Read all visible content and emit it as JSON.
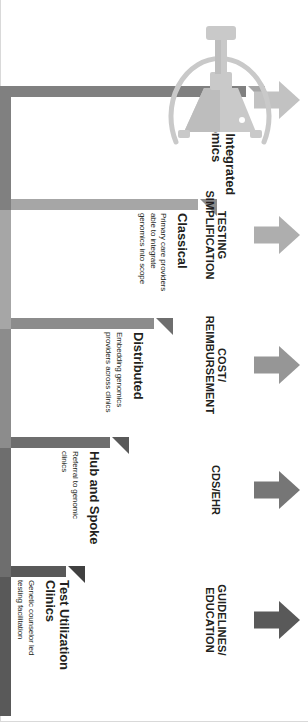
{
  "figure": {
    "orientation": "rotated-90",
    "background_color": "#ffffff"
  },
  "steps": [
    {
      "label": "Test Utilization\nClinics",
      "label_line1": "Test Utilization",
      "label_line2": "Clinics",
      "description": "Genetic counselor led\ntesting facilitation",
      "desc_line1": "Genetic counselor led",
      "desc_line2": "testing facilitation",
      "color": "#595959",
      "notch_color": "#404040",
      "level": 1
    },
    {
      "label": "Hub and Spoke",
      "label_line1": "Hub and Spoke",
      "label_line2": "",
      "description": "Referral to genomic\nclinics",
      "desc_line1": "Referral to genomic",
      "desc_line2": "clinics",
      "color": "#6e6e6e",
      "notch_color": "#595959",
      "level": 2
    },
    {
      "label": "Distributed",
      "label_line1": "Distributed",
      "label_line2": "",
      "description": "Embedding genomics\nproviders across clinics",
      "desc_line1": "Embedding genomics",
      "desc_line2": "providers across clinics",
      "color": "#8c8c8c",
      "notch_color": "#6e6e6e",
      "level": 3
    },
    {
      "label": "Classical",
      "label_line1": "Classical",
      "label_line2": "",
      "description": "Primary care providers\nable to integrate\ngenomics into scope",
      "desc_line1": "Primary care providers",
      "desc_line2": "able to integrate",
      "desc_line3": "genomics into scope",
      "color": "#a6a6a6",
      "notch_color": "#8c8c8c",
      "level": 4
    },
    {
      "label": "Fully Integrated\nGenomics",
      "label_line1": "Fully Integrated",
      "label_line2": "Genomics",
      "description": "",
      "desc_line1": "",
      "desc_line2": "",
      "color": "#808080",
      "notch_color": "#a6a6a6",
      "level": 5
    }
  ],
  "arrows": [
    {
      "label": "GUIDELINES/\nEDUCATION",
      "label_line1": "GUIDELINES/",
      "label_line2": "EDUCATION",
      "color": "#595959",
      "direction": "up"
    },
    {
      "label": "CDS/EHR",
      "label_line1": "CDS/EHR",
      "label_line2": "",
      "color": "#767676",
      "direction": "up"
    },
    {
      "label": "COST/\nREIMBURSEMENT",
      "label_line1": "COST/",
      "label_line2": "REIMBURSEMENT",
      "color": "#969696",
      "direction": "up"
    },
    {
      "label": "TESTING\nSIMPLIFICATION",
      "label_line1": "TESTING",
      "label_line2": "SIMPLIFICATION",
      "color": "#aeaeae",
      "direction": "up"
    },
    {
      "label": "",
      "label_line1": "",
      "label_line2": "",
      "color": "#c2c2c2",
      "direction": "up"
    }
  ],
  "icons": {
    "satellite_dish": "satellite-dish-icon",
    "dish_color": "#c9c9c9",
    "dish_color_dark": "#bdbdbd"
  }
}
